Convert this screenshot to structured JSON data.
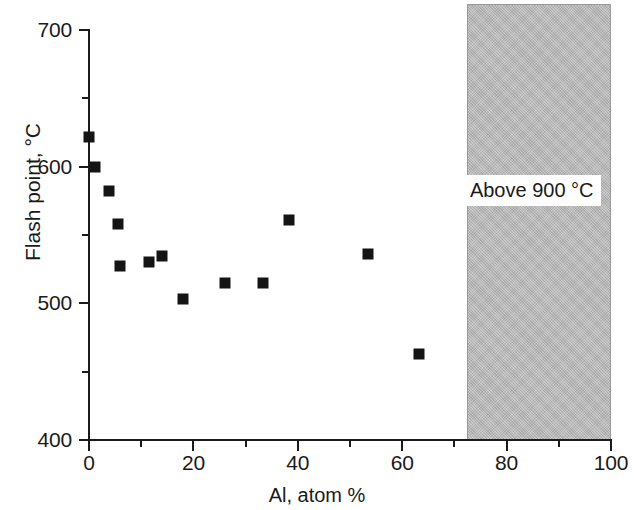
{
  "chart_data": {
    "type": "scatter",
    "title": "",
    "xlabel": "Al, atom %",
    "ylabel": "Flash point, °C",
    "xlim": [
      0,
      100
    ],
    "ylim": [
      400,
      700
    ],
    "xticks": [
      0,
      20,
      40,
      60,
      80,
      100
    ],
    "xtick_labels": [
      "0",
      "20",
      "40",
      "60",
      "80",
      "100"
    ],
    "xminor_ticks": [
      10,
      30,
      50,
      70,
      90
    ],
    "yticks": [
      400,
      500,
      600,
      700
    ],
    "ytick_labels": [
      "400",
      "500",
      "600",
      "700"
    ],
    "yminor_ticks": [
      450,
      550,
      650
    ],
    "grid": false,
    "legend": null,
    "marker": "filled-square",
    "marker_color": "#141414",
    "series": [
      {
        "name": "Flash point vs Al content",
        "points": [
          {
            "x": 0.0,
            "y": 622
          },
          {
            "x": 1.2,
            "y": 600
          },
          {
            "x": 3.8,
            "y": 582
          },
          {
            "x": 5.6,
            "y": 558
          },
          {
            "x": 6.0,
            "y": 527
          },
          {
            "x": 11.4,
            "y": 530
          },
          {
            "x": 14.0,
            "y": 535
          },
          {
            "x": 18.0,
            "y": 503
          },
          {
            "x": 26.0,
            "y": 515
          },
          {
            "x": 33.4,
            "y": 515
          },
          {
            "x": 38.4,
            "y": 561
          },
          {
            "x": 53.4,
            "y": 536
          },
          {
            "x": 63.2,
            "y": 463
          }
        ]
      }
    ],
    "annotations": [
      {
        "name": "above-900-region",
        "type": "shaded-band",
        "label": "Above 900 °C",
        "x_start": 72.5,
        "x_end": 100,
        "y_start": 400,
        "y_end": 700,
        "fill_color": "#b9b9b9",
        "label_x": 86,
        "label_y": 583
      }
    ]
  }
}
